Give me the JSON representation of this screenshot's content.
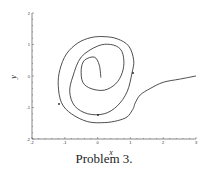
{
  "chart_data": {
    "type": "line",
    "title": "",
    "caption": "Problem 3.",
    "xlabel": "x",
    "ylabel": "y",
    "xlim": [
      -2,
      3
    ],
    "ylim": [
      -2,
      2
    ],
    "xticks": [
      "-2",
      "-1",
      "0",
      "1",
      "2",
      "3"
    ],
    "yticks": [
      "2",
      "1",
      "0",
      "-1",
      "-2"
    ],
    "grid": false,
    "legend": null,
    "series": [
      {
        "name": "trajectory (phase portrait, spiral from (3,0) into origin)",
        "x": [
          3.0,
          2.5,
          2.0,
          1.6,
          1.3,
          1.15,
          1.1,
          1.05,
          0.9,
          0.6,
          0.2,
          -0.3,
          -0.8,
          -1.1,
          -1.2,
          -1.15,
          -0.95,
          -0.6,
          -0.2,
          0.2,
          0.6,
          0.95,
          1.1,
          1.05,
          0.9,
          0.6,
          0.2,
          -0.3,
          -0.7,
          -0.85,
          -0.75,
          -0.5,
          0.0,
          0.4,
          0.7,
          0.8,
          0.75,
          0.55,
          0.2,
          -0.2,
          -0.45,
          -0.5,
          -0.4,
          -0.1,
          0.05,
          0.1
        ],
        "y": [
          0.0,
          -0.1,
          -0.2,
          -0.4,
          -0.6,
          -0.85,
          -1.0,
          -1.1,
          -1.3,
          -1.42,
          -1.48,
          -1.45,
          -1.2,
          -0.85,
          -0.3,
          0.2,
          0.7,
          1.05,
          1.22,
          1.25,
          1.18,
          0.95,
          0.5,
          0.1,
          -0.5,
          -0.95,
          -1.2,
          -1.2,
          -0.95,
          -0.5,
          0.0,
          0.6,
          0.95,
          1.0,
          0.85,
          0.5,
          0.1,
          -0.25,
          -0.45,
          -0.4,
          -0.2,
          0.2,
          0.5,
          0.6,
          0.35,
          -0.05
        ]
      }
    ]
  }
}
